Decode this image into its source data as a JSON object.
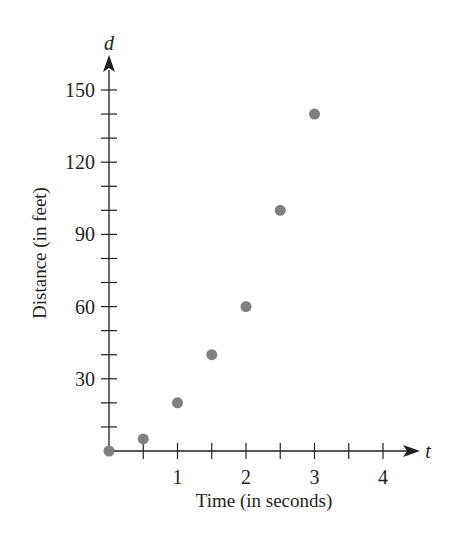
{
  "chart_data": {
    "type": "scatter",
    "title": "",
    "xlabel": "Time (in seconds)",
    "ylabel": "Distance (in feet)",
    "x_axis_variable": "t",
    "y_axis_variable": "d",
    "xlim": [
      0,
      4.5
    ],
    "ylim": [
      0,
      160
    ],
    "x_ticks": [
      1,
      2,
      3,
      4
    ],
    "x_minor_step": 0.5,
    "y_ticks": [
      30,
      60,
      90,
      120,
      150
    ],
    "y_minor_step": 10,
    "grid": false,
    "legend": null,
    "series": [
      {
        "name": "distance",
        "color": "#808080",
        "points": [
          {
            "x": 0,
            "y": 0
          },
          {
            "x": 0.5,
            "y": 5
          },
          {
            "x": 1,
            "y": 20
          },
          {
            "x": 1.5,
            "y": 40
          },
          {
            "x": 2,
            "y": 60
          },
          {
            "x": 2.5,
            "y": 100
          },
          {
            "x": 3,
            "y": 140
          }
        ]
      }
    ]
  },
  "colors": {
    "axis": "#231f20",
    "point": "#808080",
    "text": "#231f20"
  }
}
